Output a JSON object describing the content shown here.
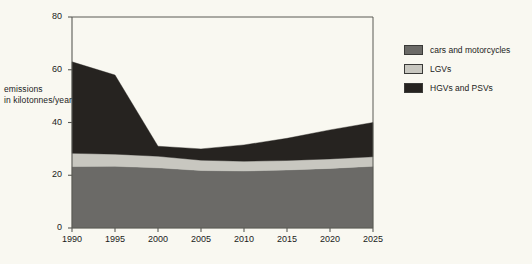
{
  "chart_data": {
    "type": "area",
    "stacked": true,
    "title": "",
    "xlabel": "",
    "ylabel": "emissions in kilotonnes/year",
    "ylabel_line1": "emissions",
    "ylabel_line2": "in kilotonnes/year",
    "x": [
      1990,
      1995,
      2000,
      2005,
      2010,
      2015,
      2020,
      2025
    ],
    "xticks": [
      "1990",
      "1995",
      "2000",
      "2005",
      "2010",
      "2015",
      "2020",
      "2025"
    ],
    "yticks": [
      "0",
      "20",
      "40",
      "60",
      "80"
    ],
    "ytick_values": [
      0,
      20,
      40,
      60,
      80
    ],
    "xlim": [
      1990,
      2025
    ],
    "ylim": [
      0,
      80
    ],
    "grid": false,
    "legend_position": "right",
    "series": [
      {
        "name": "cars and motorcycles",
        "color": "#6b6a67",
        "values": [
          23.3,
          23.4,
          22.8,
          21.8,
          21.6,
          22.0,
          22.6,
          23.4
        ]
      },
      {
        "name": "LGVs",
        "color": "#c8c7c0",
        "values": [
          5.0,
          4.6,
          4.4,
          3.9,
          3.7,
          3.6,
          3.6,
          3.6
        ]
      },
      {
        "name": "HGVs and PSVs",
        "color": "#262320",
        "values": [
          34.7,
          30.0,
          3.8,
          4.3,
          6.2,
          8.4,
          11.0,
          13.0
        ]
      }
    ],
    "totals": [
      63.0,
      58.0,
      31.0,
      30.0,
      31.5,
      34.0,
      37.2,
      40.0
    ]
  },
  "legend": {
    "items": [
      {
        "label": "cars and motorcycles",
        "color": "#6b6a67"
      },
      {
        "label": "LGVs",
        "color": "#c8c7c0"
      },
      {
        "label": "HGVs and PSVs",
        "color": "#262320"
      }
    ]
  },
  "colors": {
    "background": "#f9f8f1",
    "axis": "#5a5a55",
    "text": "#1b1b1b"
  }
}
